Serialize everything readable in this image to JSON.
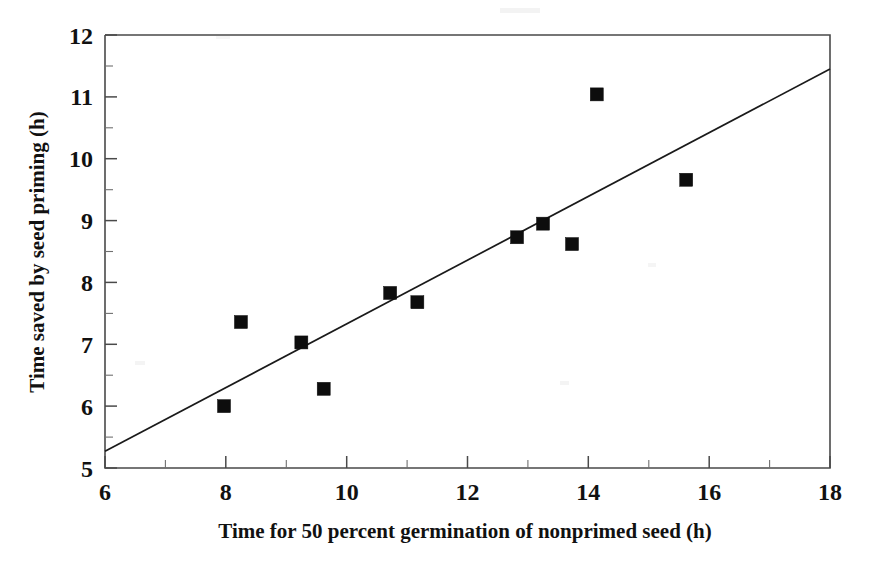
{
  "chart_data": {
    "type": "scatter",
    "title": "",
    "xlabel": "Time for 50 percent germination of nonprimed seed (h)",
    "ylabel": "Time saved by seed priming (h)",
    "xlim": [
      6,
      18
    ],
    "ylim": [
      5,
      12
    ],
    "xticks": [
      6,
      8,
      10,
      12,
      14,
      16,
      18
    ],
    "xtick_labels": [
      "6",
      "8",
      "10",
      "12",
      "14",
      "16",
      "18"
    ],
    "yticks": [
      5,
      6,
      7,
      8,
      9,
      10,
      11,
      12
    ],
    "ytick_labels": [
      "5",
      "6",
      "7",
      "8",
      "9",
      "10",
      "11",
      "12"
    ],
    "x_minor_tick_step": 1,
    "y_minor_tick_step": 0.5,
    "grid": false,
    "legend": false,
    "legend_position": "none",
    "marker_shape": "square",
    "marker_color": "#0d0d0d",
    "marker_size": 13,
    "points": [
      {
        "x": 7.97,
        "y": 6.0
      },
      {
        "x": 8.25,
        "y": 7.36
      },
      {
        "x": 9.25,
        "y": 7.03
      },
      {
        "x": 9.62,
        "y": 6.28
      },
      {
        "x": 10.72,
        "y": 7.83
      },
      {
        "x": 11.17,
        "y": 7.68
      },
      {
        "x": 12.82,
        "y": 8.73
      },
      {
        "x": 13.25,
        "y": 8.95
      },
      {
        "x": 13.73,
        "y": 8.62
      },
      {
        "x": 14.14,
        "y": 11.04
      },
      {
        "x": 15.62,
        "y": 9.66
      }
    ],
    "series": [
      {
        "name": "Observations",
        "x": [
          7.97,
          8.25,
          9.25,
          9.62,
          10.72,
          11.17,
          12.82,
          13.25,
          13.73,
          14.14,
          15.62
        ],
        "values": [
          6.0,
          7.36,
          7.03,
          6.28,
          7.83,
          7.68,
          8.73,
          8.95,
          8.62,
          11.04,
          9.66
        ]
      }
    ],
    "trend_line": {
      "type": "linear-fit",
      "x_start": 6,
      "y_start": 5.27,
      "x_end": 18,
      "y_end": 11.45,
      "slope": 0.515,
      "intercept": 2.18,
      "color": "#1a1a1a"
    },
    "annotations": []
  }
}
